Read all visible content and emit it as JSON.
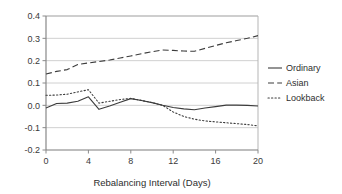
{
  "chart_data": {
    "type": "line",
    "title": "",
    "subtitle": "",
    "xlabel": "Rebalancing Interval (Days)",
    "ylabel": "",
    "xlim": [
      0,
      20
    ],
    "ylim": [
      -0.2,
      0.4
    ],
    "xticks": [
      "0",
      "4",
      "8",
      "12",
      "16",
      "20"
    ],
    "xtick_values": [
      0,
      4,
      8,
      12,
      16,
      20
    ],
    "yticks": [
      "0.4",
      "0.3",
      "0.2",
      "0.1",
      "0.0",
      "-0.1",
      "-0.2"
    ],
    "ytick_values": [
      0.4,
      0.3,
      0.2,
      0.1,
      0.0,
      -0.1,
      -0.2
    ],
    "grid": "horizontal",
    "legend_position": "right",
    "x": [
      0,
      1,
      2,
      3,
      4,
      5,
      6,
      7,
      8,
      9,
      10,
      11,
      12,
      13,
      14,
      15,
      16,
      17,
      18,
      19,
      20
    ],
    "series": [
      {
        "name": "Ordinary",
        "style": "solid",
        "color": "#3c3c3c",
        "values": [
          -0.012,
          0.008,
          0.01,
          0.018,
          0.038,
          -0.018,
          -0.003,
          0.014,
          0.03,
          0.022,
          0.012,
          0.0,
          -0.01,
          -0.016,
          -0.02,
          -0.012,
          -0.006,
          0.001,
          0.001,
          0.0,
          -0.003
        ]
      },
      {
        "name": "Asian",
        "style": "dashed",
        "color": "#3c3c3c",
        "values": [
          0.14,
          0.152,
          0.16,
          0.183,
          0.19,
          0.196,
          0.203,
          0.212,
          0.221,
          0.231,
          0.24,
          0.248,
          0.246,
          0.243,
          0.242,
          0.255,
          0.268,
          0.28,
          0.29,
          0.3,
          0.312
        ]
      },
      {
        "name": "Lookback",
        "style": "dotted",
        "color": "#3c3c3c",
        "values": [
          0.045,
          0.046,
          0.05,
          0.06,
          0.07,
          0.01,
          0.018,
          0.026,
          0.031,
          0.022,
          0.012,
          0.0,
          -0.03,
          -0.05,
          -0.062,
          -0.07,
          -0.074,
          -0.078,
          -0.082,
          -0.086,
          -0.092
        ]
      }
    ]
  },
  "legend": {
    "items": [
      {
        "label": "Ordinary",
        "marker": "solid-line-marker"
      },
      {
        "label": "Asian",
        "marker": "dashed-line-marker"
      },
      {
        "label": "Lookback",
        "marker": "dotted-line-marker"
      }
    ]
  },
  "axes": {
    "x_title": "Rebalancing Interval (Days)"
  },
  "colors": {
    "line": "#3c3c3c",
    "grid": "#d0d0d0",
    "axis": "#8a8a8a",
    "text": "#2e2e2e",
    "background": "#ffffff"
  }
}
